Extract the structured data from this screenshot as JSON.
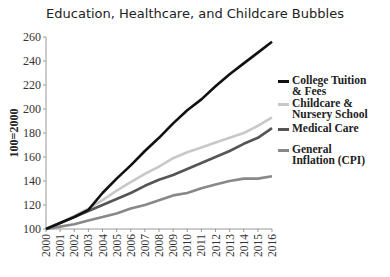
{
  "chart_data": {
    "type": "line",
    "title": "Education, Healthcare, and Childcare Bubbles",
    "xlabel": "",
    "ylabel": "100=2000",
    "ylim": [
      100,
      260
    ],
    "xlim": [
      2000,
      2016
    ],
    "grid": false,
    "legend_position": "right",
    "yticks": [
      100,
      120,
      140,
      160,
      180,
      200,
      220,
      240,
      260
    ],
    "x": [
      2000,
      2001,
      2002,
      2003,
      2004,
      2005,
      2006,
      2007,
      2008,
      2009,
      2010,
      2011,
      2012,
      2013,
      2014,
      2015,
      2016
    ],
    "series": [
      {
        "name": "College Tuition & Fees",
        "color": "#111111",
        "values": [
          100,
          105,
          110,
          116,
          130,
          142,
          153,
          165,
          176,
          188,
          199,
          208,
          219,
          229,
          238,
          247,
          256
        ]
      },
      {
        "name": "Childcare & Nursery School",
        "color": "#c8c8c8",
        "values": [
          100,
          105,
          111,
          117,
          124,
          132,
          139,
          146,
          152,
          159,
          164,
          168,
          172,
          176,
          180,
          186,
          193
        ]
      },
      {
        "name": "Medical Care",
        "color": "#555555",
        "values": [
          100,
          105,
          110,
          115,
          120,
          125,
          130,
          136,
          141,
          145,
          150,
          155,
          160,
          165,
          171,
          176,
          184
        ]
      },
      {
        "name": "General Inflation (CPI)",
        "color": "#888888",
        "values": [
          100,
          102,
          104,
          107,
          110,
          113,
          117,
          120,
          124,
          128,
          130,
          134,
          137,
          140,
          142,
          142,
          144
        ]
      }
    ]
  },
  "footer": "Source: Bureau of Labor Statistics"
}
